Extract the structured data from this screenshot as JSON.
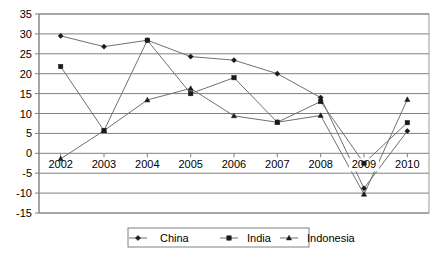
{
  "chart_data": {
    "type": "line",
    "title": "",
    "xlabel": "",
    "ylabel": "",
    "categories": [
      "2002",
      "2003",
      "2004",
      "2005",
      "2006",
      "2007",
      "2008",
      "2009",
      "2010"
    ],
    "ylim": [
      -15,
      35
    ],
    "ytick_step": 5,
    "yticks": [
      "35",
      "30",
      "25",
      "20",
      "15",
      "10",
      "5",
      "0",
      "-5",
      "-10",
      "-15"
    ],
    "grid": true,
    "legend_position": "bottom",
    "series": [
      {
        "name": "China",
        "marker": "diamond",
        "color": "#1a1a1a",
        "values": [
          29.5,
          26.8,
          28.4,
          24.3,
          23.4,
          20.0,
          14.0,
          -8.8,
          5.6
        ]
      },
      {
        "name": "India",
        "marker": "square",
        "color": "#1a1a1a",
        "values": [
          21.8,
          5.7,
          28.4,
          15.0,
          19.0,
          7.8,
          13.0,
          -2.5,
          7.7
        ]
      },
      {
        "name": "Indonesia",
        "marker": "triangle",
        "color": "#1a1a1a",
        "values": [
          -1.4,
          5.7,
          13.4,
          16.3,
          9.4,
          7.8,
          9.5,
          -10.3,
          13.5
        ]
      }
    ]
  },
  "legend": {
    "items": [
      {
        "label": "China",
        "marker": "diamond"
      },
      {
        "label": "India",
        "marker": "square"
      },
      {
        "label": "Indonesia",
        "marker": "triangle"
      }
    ]
  }
}
